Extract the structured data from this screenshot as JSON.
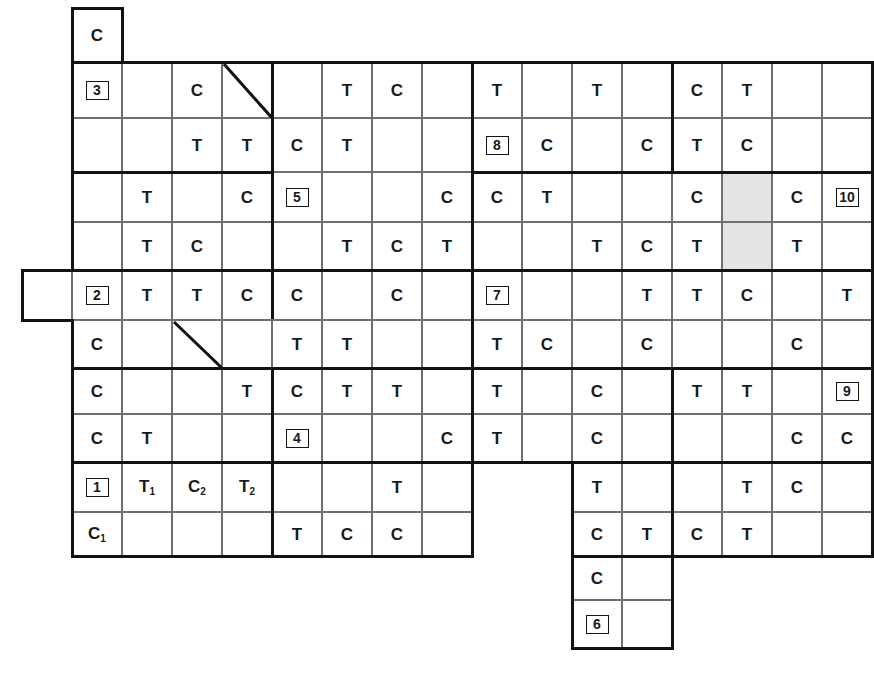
{
  "figure": {
    "type": "crossword-style-lattice-grid",
    "cell_width": 50,
    "cell_height": 51,
    "origin_x": 72,
    "origin_y": 8,
    "columns": 16,
    "rows": 10,
    "letters_used": [
      "C",
      "T"
    ],
    "clue_numbers": [
      1,
      2,
      3,
      4,
      5,
      6,
      7,
      8,
      9,
      10
    ],
    "colors": {
      "grid_line": "#6f6f6f",
      "block_line": "#121212",
      "background": "#ffffff",
      "shaded_cell": "#e4e4e4",
      "text": "#1a1a1a"
    }
  },
  "grid": {
    "rows": [
      {
        "index": 0,
        "cells": [
          {
            "col": 0,
            "text": "C"
          }
        ]
      },
      {
        "index": 1,
        "cells": [
          {
            "col": 0,
            "num": "3"
          },
          {
            "col": 1,
            "text": ""
          },
          {
            "col": 2,
            "text": "C"
          },
          {
            "col": 3,
            "text": "",
            "diagonal": true
          },
          {
            "col": 4,
            "text": ""
          },
          {
            "col": 5,
            "text": "T"
          },
          {
            "col": 6,
            "text": "C"
          },
          {
            "col": 7,
            "text": ""
          },
          {
            "col": 8,
            "text": "T"
          },
          {
            "col": 9,
            "text": ""
          },
          {
            "col": 10,
            "text": "T"
          },
          {
            "col": 11,
            "text": ""
          },
          {
            "col": 12,
            "text": "C"
          },
          {
            "col": 13,
            "text": "T"
          },
          {
            "col": 14,
            "text": ""
          },
          {
            "col": 15,
            "text": ""
          }
        ]
      },
      {
        "index": 2,
        "cells": [
          {
            "col": 0,
            "text": ""
          },
          {
            "col": 1,
            "text": ""
          },
          {
            "col": 2,
            "text": "T"
          },
          {
            "col": 3,
            "text": "T"
          },
          {
            "col": 4,
            "text": "C"
          },
          {
            "col": 5,
            "text": "T"
          },
          {
            "col": 6,
            "text": ""
          },
          {
            "col": 7,
            "text": ""
          },
          {
            "col": 8,
            "num": "8"
          },
          {
            "col": 9,
            "text": "C"
          },
          {
            "col": 10,
            "text": ""
          },
          {
            "col": 11,
            "text": "C"
          },
          {
            "col": 12,
            "text": "T"
          },
          {
            "col": 13,
            "text": "C"
          },
          {
            "col": 14,
            "text": ""
          },
          {
            "col": 15,
            "text": ""
          }
        ]
      },
      {
        "index": 3,
        "cells": [
          {
            "col": 0,
            "text": ""
          },
          {
            "col": 1,
            "text": "T"
          },
          {
            "col": 2,
            "text": ""
          },
          {
            "col": 3,
            "text": "C"
          },
          {
            "col": 4,
            "num": "5"
          },
          {
            "col": 5,
            "text": ""
          },
          {
            "col": 6,
            "text": ""
          },
          {
            "col": 7,
            "text": "C"
          },
          {
            "col": 8,
            "text": "C"
          },
          {
            "col": 9,
            "text": "T"
          },
          {
            "col": 10,
            "text": ""
          },
          {
            "col": 11,
            "text": ""
          },
          {
            "col": 12,
            "text": "C"
          },
          {
            "col": 13,
            "text": "",
            "shaded": true
          },
          {
            "col": 14,
            "text": "C"
          },
          {
            "col": 15,
            "num": "10"
          }
        ]
      },
      {
        "index": 4,
        "cells": [
          {
            "col": 0,
            "text": ""
          },
          {
            "col": 1,
            "text": "T"
          },
          {
            "col": 2,
            "text": "C"
          },
          {
            "col": 3,
            "text": ""
          },
          {
            "col": 4,
            "text": ""
          },
          {
            "col": 5,
            "text": "T"
          },
          {
            "col": 6,
            "text": "C"
          },
          {
            "col": 7,
            "text": "T"
          },
          {
            "col": 8,
            "text": ""
          },
          {
            "col": 9,
            "text": ""
          },
          {
            "col": 10,
            "text": "T"
          },
          {
            "col": 11,
            "text": "C"
          },
          {
            "col": 12,
            "text": "T"
          },
          {
            "col": 13,
            "text": "",
            "shaded": true
          },
          {
            "col": 14,
            "text": "T"
          },
          {
            "col": 15,
            "text": ""
          }
        ]
      },
      {
        "index": 5,
        "cells": [
          {
            "col": -1,
            "text": "",
            "spur": true
          },
          {
            "col": 0,
            "num": "2"
          },
          {
            "col": 1,
            "text": "T"
          },
          {
            "col": 2,
            "text": "T"
          },
          {
            "col": 3,
            "text": "C"
          },
          {
            "col": 4,
            "text": "C"
          },
          {
            "col": 5,
            "text": ""
          },
          {
            "col": 6,
            "text": "C"
          },
          {
            "col": 7,
            "text": ""
          },
          {
            "col": 8,
            "num": "7"
          },
          {
            "col": 9,
            "text": ""
          },
          {
            "col": 10,
            "text": ""
          },
          {
            "col": 11,
            "text": "T"
          },
          {
            "col": 12,
            "text": "T"
          },
          {
            "col": 13,
            "text": "C"
          },
          {
            "col": 14,
            "text": ""
          },
          {
            "col": 15,
            "text": "T"
          }
        ]
      },
      {
        "index": 6,
        "cells": [
          {
            "col": 0,
            "text": "C"
          },
          {
            "col": 1,
            "text": ""
          },
          {
            "col": 2,
            "text": "",
            "diagonal": true
          },
          {
            "col": 3,
            "text": ""
          },
          {
            "col": 4,
            "text": "T"
          },
          {
            "col": 5,
            "text": "T"
          },
          {
            "col": 6,
            "text": ""
          },
          {
            "col": 7,
            "text": ""
          },
          {
            "col": 8,
            "text": "T"
          },
          {
            "col": 9,
            "text": "C"
          },
          {
            "col": 10,
            "text": ""
          },
          {
            "col": 11,
            "text": "C"
          },
          {
            "col": 12,
            "text": ""
          },
          {
            "col": 13,
            "text": ""
          },
          {
            "col": 14,
            "text": "C"
          },
          {
            "col": 15,
            "text": ""
          }
        ]
      },
      {
        "index": 7,
        "cells": [
          {
            "col": 0,
            "text": "C"
          },
          {
            "col": 1,
            "text": ""
          },
          {
            "col": 2,
            "text": ""
          },
          {
            "col": 3,
            "text": "T"
          },
          {
            "col": 4,
            "text": "C"
          },
          {
            "col": 5,
            "text": "T"
          },
          {
            "col": 6,
            "text": "T"
          },
          {
            "col": 7,
            "text": ""
          },
          {
            "col": 8,
            "text": "T"
          },
          {
            "col": 9,
            "text": ""
          },
          {
            "col": 10,
            "text": "C"
          },
          {
            "col": 11,
            "text": ""
          },
          {
            "col": 12,
            "text": "T"
          },
          {
            "col": 13,
            "text": "T"
          },
          {
            "col": 14,
            "text": ""
          },
          {
            "col": 15,
            "num": "9"
          }
        ]
      },
      {
        "index": 8,
        "cells": [
          {
            "col": 0,
            "text": "C"
          },
          {
            "col": 1,
            "text": "T"
          },
          {
            "col": 2,
            "text": ""
          },
          {
            "col": 3,
            "text": ""
          },
          {
            "col": 4,
            "num": "4"
          },
          {
            "col": 5,
            "text": ""
          },
          {
            "col": 6,
            "text": ""
          },
          {
            "col": 7,
            "text": "C"
          },
          {
            "col": 8,
            "text": "T"
          },
          {
            "col": 9,
            "text": ""
          },
          {
            "col": 10,
            "text": "C"
          },
          {
            "col": 11,
            "text": ""
          },
          {
            "col": 12,
            "text": ""
          },
          {
            "col": 13,
            "text": ""
          },
          {
            "col": 14,
            "text": "C"
          },
          {
            "col": 15,
            "text": "C"
          }
        ]
      },
      {
        "index": 9,
        "cells": [
          {
            "col": 0,
            "num": "1"
          },
          {
            "col": 1,
            "text": "T",
            "subscript": "1"
          },
          {
            "col": 2,
            "text": "C",
            "subscript": "2"
          },
          {
            "col": 3,
            "text": "T",
            "subscript": "2"
          },
          {
            "col": 4,
            "text": ""
          },
          {
            "col": 5,
            "text": ""
          },
          {
            "col": 6,
            "text": "T"
          },
          {
            "col": 7,
            "text": ""
          },
          {
            "col": 10,
            "text": "T"
          },
          {
            "col": 11,
            "text": ""
          },
          {
            "col": 12,
            "text": ""
          },
          {
            "col": 13,
            "text": "T"
          },
          {
            "col": 14,
            "text": "C"
          },
          {
            "col": 15,
            "text": ""
          }
        ]
      },
      {
        "index": 10,
        "cells": [
          {
            "col": 0,
            "text": "C",
            "subscript": "1"
          },
          {
            "col": 1,
            "text": ""
          },
          {
            "col": 2,
            "text": ""
          },
          {
            "col": 3,
            "text": ""
          },
          {
            "col": 4,
            "text": "T"
          },
          {
            "col": 5,
            "text": "C"
          },
          {
            "col": 6,
            "text": "C"
          },
          {
            "col": 7,
            "text": ""
          },
          {
            "col": 10,
            "text": "C"
          },
          {
            "col": 11,
            "text": "T"
          },
          {
            "col": 12,
            "text": "C"
          },
          {
            "col": 13,
            "text": "T"
          },
          {
            "col": 14,
            "text": ""
          },
          {
            "col": 15,
            "text": ""
          }
        ]
      },
      {
        "index": 11,
        "cells": [
          {
            "col": 10,
            "text": "C"
          },
          {
            "col": 11,
            "text": ""
          }
        ]
      },
      {
        "index": 12,
        "cells": [
          {
            "col": 10,
            "num": "6"
          },
          {
            "col": 11,
            "text": ""
          }
        ]
      }
    ]
  }
}
